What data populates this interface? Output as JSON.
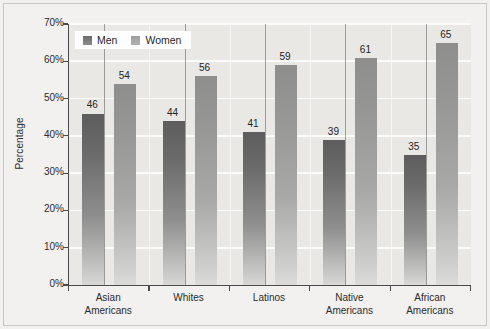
{
  "chart_data": {
    "type": "bar",
    "title": "",
    "xlabel": "",
    "ylabel": "Percentage",
    "categories": [
      "Asian\nAmericans",
      "Whites",
      "Latinos",
      "Native\nAmericans",
      "African\nAmericans"
    ],
    "category_lines": [
      [
        "Asian",
        "Americans"
      ],
      [
        "Whites",
        ""
      ],
      [
        "Latinos",
        ""
      ],
      [
        "Native",
        "Americans"
      ],
      [
        "African",
        "Americans"
      ]
    ],
    "series": [
      {
        "name": "Men",
        "values": [
          46,
          44,
          41,
          39,
          35
        ],
        "color": "#6b6b6b"
      },
      {
        "name": "Women",
        "values": [
          54,
          56,
          59,
          61,
          65
        ],
        "color": "#9d9d9b"
      }
    ],
    "ylim": [
      0,
      70
    ],
    "ytick_values": [
      70,
      60,
      50,
      40,
      30,
      20,
      10,
      0
    ],
    "ytick_labels": [
      "70%",
      "60%",
      "50%",
      "40%",
      "30%",
      "20%",
      "10%",
      "0%"
    ],
    "grid": true,
    "grid_axis": "y",
    "legend_position": "upper-left-inside",
    "value_labels": true,
    "colors": {
      "figure_background": "#f2f1ef",
      "plot_background": "#e9e8e5",
      "gridline": "#fbfbfa",
      "axis": "#4a4a4a",
      "text": "#2b2b2b",
      "men_bar": "#6b6b6b",
      "women_bar": "#9d9d9b"
    }
  },
  "legend": {
    "items": [
      {
        "label": "Men",
        "swatch": "men-swatch"
      },
      {
        "label": "Women",
        "swatch": "women-swatch"
      }
    ]
  }
}
